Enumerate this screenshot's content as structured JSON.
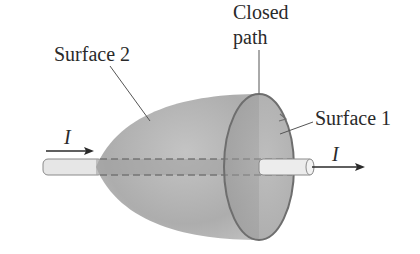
{
  "diagram": {
    "labels": {
      "surface2": "Surface 2",
      "surface1": "Surface 1",
      "closed_path_line1": "Closed",
      "closed_path_line2": "path",
      "current_in": "I",
      "current_out": "I"
    },
    "colors": {
      "surface_fill": "#a8a8a8",
      "surface_light": "#c8c8c8",
      "outline": "#6e6e6e",
      "wire_fill": "#e6e6e6",
      "text": "#2a2a2a"
    }
  }
}
